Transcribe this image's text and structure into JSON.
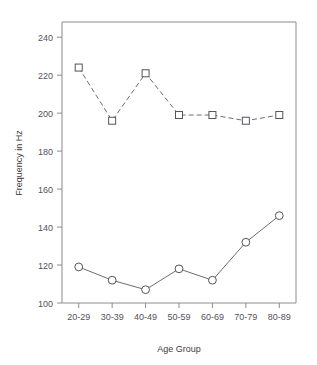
{
  "chart_data": {
    "type": "line",
    "title": "",
    "xlabel": "Age Group",
    "ylabel": "Frequency in Hz",
    "categories": [
      "20-29",
      "30-39",
      "40-49",
      "50-59",
      "60-69",
      "70-79",
      "80-89"
    ],
    "series": [
      {
        "name": "upper-series",
        "marker": "square",
        "linestyle": "dashed",
        "color": "#6e6a72",
        "values": [
          224,
          196,
          221,
          199,
          199,
          196,
          199
        ]
      },
      {
        "name": "lower-series",
        "marker": "circle",
        "linestyle": "solid",
        "color": "#6e6a72",
        "values": [
          119,
          112,
          107,
          118,
          112,
          132,
          146
        ]
      }
    ],
    "ylim": [
      100,
      248
    ],
    "yticks": [
      100,
      120,
      140,
      160,
      180,
      200,
      220,
      240
    ],
    "ytick_labels": [
      "100",
      "120",
      "140",
      "160",
      "180",
      "200",
      "220",
      "240"
    ],
    "grid": false,
    "legend": "none",
    "background_color": "#ffffff",
    "axis_color": "#8c8c90"
  }
}
